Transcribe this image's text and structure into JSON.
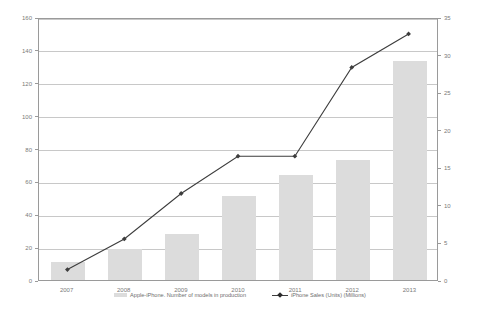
{
  "chart_data": {
    "type": "bar",
    "title": "",
    "subtitle": "",
    "xlabel": "",
    "ylabel": "",
    "categories": [
      "2007",
      "2008",
      "2009",
      "2010",
      "2011",
      "2012",
      "2013"
    ],
    "grid": true,
    "legend_position": "bottom",
    "series": [
      {
        "name": "Apple-iPhone. Number of models in production",
        "type": "bar",
        "axis": "left",
        "color": "#dcdcdc",
        "values": [
          11,
          19,
          28,
          51,
          64,
          73,
          133
        ]
      },
      {
        "name": "iPhone Sales (Units) (Millions)",
        "type": "line",
        "axis": "right",
        "color": "#3d3d3d",
        "values": [
          1.4,
          5.5,
          11.6,
          16.6,
          16.6,
          28.5,
          33.0
        ]
      }
    ],
    "axes": {
      "left": {
        "label": "",
        "min": 0,
        "max": 160,
        "step": 20,
        "ticks": [
          "0",
          "20",
          "40",
          "60",
          "80",
          "100",
          "120",
          "140",
          "160"
        ]
      },
      "right": {
        "label": "",
        "min": 0,
        "max": 35,
        "step": 5,
        "ticks": [
          "0",
          "5",
          "10",
          "15",
          "20",
          "25",
          "30",
          "35"
        ]
      },
      "x": {
        "label": "",
        "ticks": [
          "2007",
          "2008",
          "2009",
          "2010",
          "2011",
          "2012",
          "2013"
        ]
      }
    }
  },
  "legend": {
    "entries": [
      {
        "label": "Apple-iPhone. Number of models in production",
        "marker": "bar-swatch"
      },
      {
        "label": "iPhone Sales (Units) (Millions)",
        "marker": "line-marker"
      }
    ]
  },
  "colors": {
    "bar_fill": "#dcdcdc",
    "line_stroke": "#3d3d3d",
    "gridline": "#c8c8c8",
    "frame": "#9a9a9a",
    "tick_text": "#7a7a7a",
    "legend_text": "#6d6d6d",
    "background": "#ffffff"
  }
}
